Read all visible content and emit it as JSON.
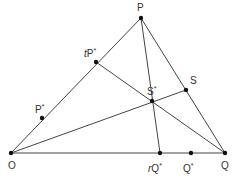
{
  "diagram": {
    "type": "geometry-triangle",
    "line_color": "#444444",
    "point_color": "#111111",
    "points": {
      "O": {
        "x": 11,
        "y": 153,
        "label": "O"
      },
      "P": {
        "x": 141,
        "y": 18,
        "label": "P"
      },
      "Q": {
        "x": 225,
        "y": 153,
        "label": "Q"
      },
      "tPs": {
        "x": 96,
        "y": 62,
        "label": "tP",
        "prefix": "t",
        "sup": "*"
      },
      "Ps": {
        "x": 42,
        "y": 118,
        "label": "P",
        "sup": "*"
      },
      "S": {
        "x": 186,
        "y": 90,
        "label": "S"
      },
      "Ss": {
        "x": 152,
        "y": 101,
        "label": "S",
        "sup": "*"
      },
      "rQs": {
        "x": 160,
        "y": 153,
        "label": "rQ",
        "prefix": "r",
        "sup": "*"
      },
      "Qs": {
        "x": 191,
        "y": 153,
        "label": "Q",
        "sup": "*"
      }
    },
    "labels": {
      "P": "P",
      "tPs_prefix": "t",
      "tPs_main": "P",
      "Ps_main": "P",
      "S": "S",
      "Ss_main": "S",
      "O": "O",
      "rQs_prefix": "r",
      "rQs_main": "Q",
      "Qs_main": "Q",
      "Q": "Q",
      "star": "*"
    }
  }
}
